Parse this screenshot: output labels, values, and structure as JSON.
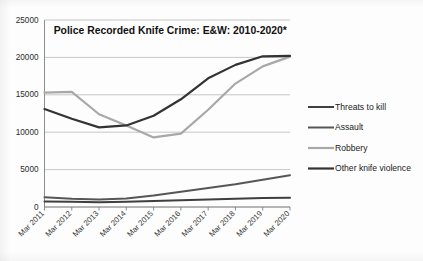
{
  "chart_data": {
    "type": "line",
    "title": "Police Recorded Knife Crime: E&W:  2010-2020*",
    "xlabel": "",
    "ylabel": "",
    "ylim": [
      0,
      25000
    ],
    "ytick_values": [
      0,
      5000,
      10000,
      15000,
      20000,
      25000
    ],
    "ytick_labels": [
      "0",
      "5000",
      "10000",
      "15000",
      "20000",
      "25000"
    ],
    "grid": true,
    "legend_position": "right",
    "categories": [
      "Mar 2011",
      "Mar 2012",
      "Mar 2013",
      "Mar 2014",
      "Mar 2015",
      "Mar 2016",
      "Mar 2017",
      "Mar 2018",
      "Mar 2019",
      "Mar 2020"
    ],
    "series": [
      {
        "name": "Threats to kill",
        "color": "#3f3f3f",
        "values": [
          750,
          700,
          620,
          700,
          800,
          900,
          1000,
          1100,
          1200,
          1250
        ]
      },
      {
        "name": "Assault",
        "color": "#565656",
        "values": [
          1300,
          1100,
          1000,
          1150,
          1550,
          2050,
          2550,
          3050,
          3650,
          4250
        ]
      },
      {
        "name": "Robbery",
        "color": "#a8a8a8",
        "values": [
          15300,
          15400,
          12400,
          10900,
          9300,
          9800,
          13000,
          16500,
          18800,
          20100
        ]
      },
      {
        "name": "Other knife violence",
        "color": "#333333",
        "values": [
          13100,
          11800,
          10650,
          10900,
          12200,
          14400,
          17200,
          19000,
          20150,
          20200
        ]
      }
    ]
  }
}
